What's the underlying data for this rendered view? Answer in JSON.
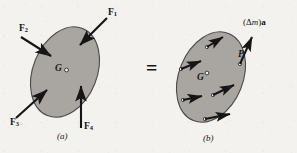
{
  "figure": {
    "type": "physics-free-body-diagram",
    "background_color": "#f4f2ef",
    "body_fill_color": "#a9a6a2",
    "body_stroke_color": "#3a3a3a",
    "arrow_color": "#151515",
    "equals_sign": "="
  },
  "panel_a": {
    "caption": "(a)",
    "center_label": "G",
    "forces": [
      {
        "name": "F",
        "subscript": "1",
        "label": "F"
      },
      {
        "name": "F",
        "subscript": "2",
        "label": "F"
      },
      {
        "name": "F",
        "subscript": "3",
        "label": "F"
      },
      {
        "name": "F",
        "subscript": "4",
        "label": "F"
      }
    ]
  },
  "panel_b": {
    "caption": "(b)",
    "center_label": "G",
    "point_label": "P",
    "inertia_force": {
      "open_paren": "(",
      "delta": "Δ",
      "mass_symbol": "m",
      "close_paren": ")",
      "accel_symbol": "a"
    },
    "element_count": 6
  }
}
